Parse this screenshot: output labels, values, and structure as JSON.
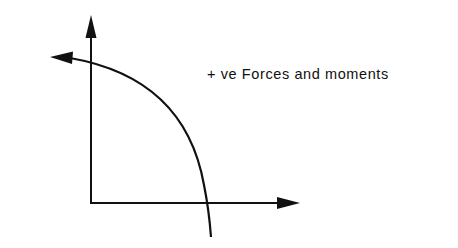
{
  "diagram": {
    "label": "+ ve Forces and moments",
    "stroke_color": "#111111",
    "background": "#ffffff",
    "elements": {
      "vertical_axis": {
        "direction": "up",
        "arrowhead": true
      },
      "horizontal_axis": {
        "direction": "right",
        "arrowhead": true
      },
      "moment_arc": {
        "direction": "counter-clockwise",
        "arrowhead": true
      }
    }
  }
}
